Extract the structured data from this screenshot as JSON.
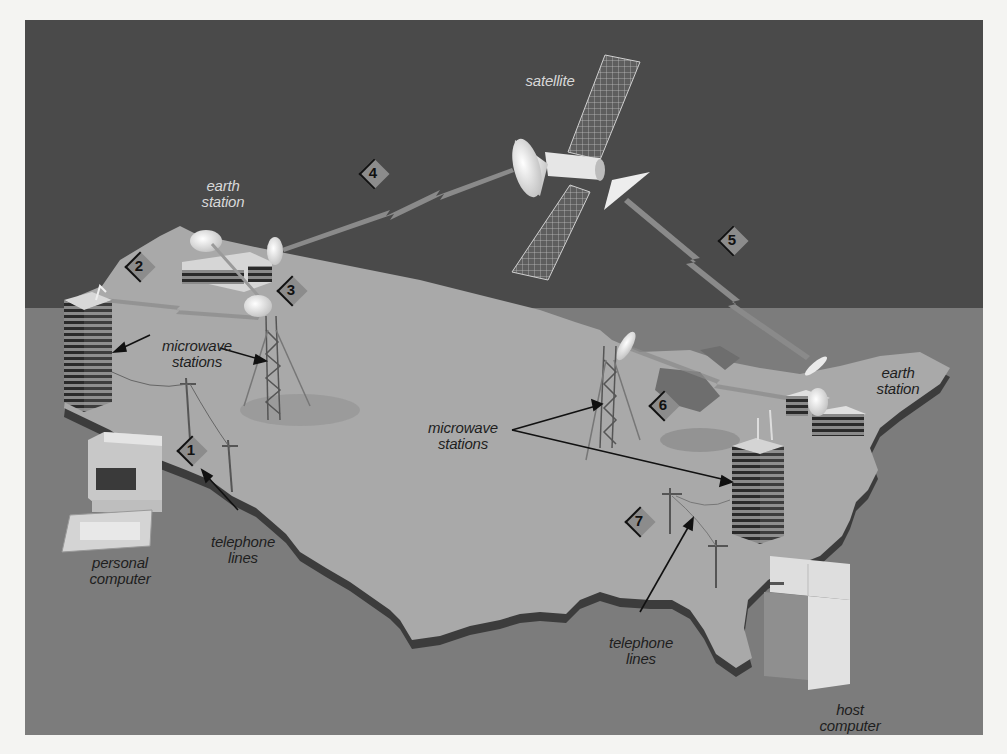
{
  "diagram": {
    "colors": {
      "page_bg": "#f4f4f2",
      "sky": "#4a4a4a",
      "floor": "#7c7c7c",
      "land": "#a9a9a9",
      "land_edge": "#3c3c3c",
      "marker_fill": "#8c8c8c"
    },
    "labels": {
      "satellite": "satellite",
      "earth_station_west": "earth\nstation",
      "earth_station_east": "earth\nstation",
      "microwave_west": "microwave\nstations",
      "microwave_east": "microwave\nstations",
      "telephone_west": "telephone\nlines",
      "telephone_east": "telephone\nlines",
      "personal_computer": "personal\ncomputer",
      "host_computer": "host\ncomputer"
    },
    "markers": [
      {
        "id": "1",
        "x": 180,
        "y": 437
      },
      {
        "id": "2",
        "x": 128,
        "y": 253
      },
      {
        "id": "3",
        "x": 280,
        "y": 277
      },
      {
        "id": "4",
        "x": 362,
        "y": 160
      },
      {
        "id": "5",
        "x": 721,
        "y": 227
      },
      {
        "id": "6",
        "x": 652,
        "y": 392
      },
      {
        "id": "7",
        "x": 628,
        "y": 508
      }
    ]
  }
}
